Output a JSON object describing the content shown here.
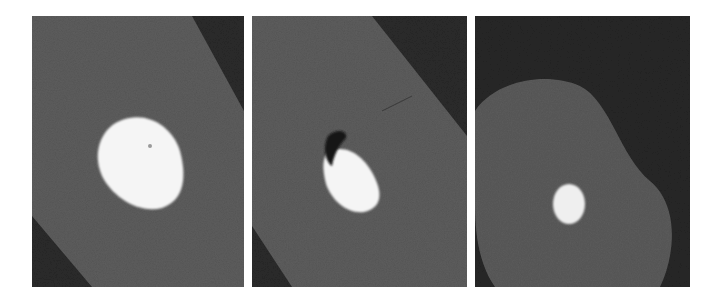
{
  "figure": {
    "panel_count": 3,
    "panels": [
      {
        "index": 1,
        "description": "CT cross-section: large bright oval inclusion in gray tissue band, dark background corners",
        "background": "#2a2a2a",
        "tissue": "#5c5c5c",
        "inclusion": "#f4f4f4"
      },
      {
        "index": 2,
        "description": "CT cross-section: bright inclusion with dark air pocket at top-left, within gray tissue band",
        "background": "#2a2a2a",
        "tissue": "#5c5c5c",
        "inclusion": "#f4f4f4",
        "air_pocket": "#151515"
      },
      {
        "index": 3,
        "description": "CT cross-section: rounded gray tissue region with small bright inclusion, dark background",
        "background": "#262626",
        "tissue": "#5a5a5a",
        "inclusion": "#eeeeee"
      }
    ]
  }
}
